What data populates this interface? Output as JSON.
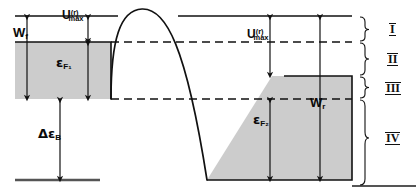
{
  "figure": {
    "type": "energy-band-diagram",
    "background_color": "#ffffff",
    "line_color": "#111111",
    "fill_color": "#cccccc",
    "dashed_color": "#111111"
  },
  "labels": {
    "u_max_left": {
      "base": "U",
      "sup": "(r)",
      "sub": "max"
    },
    "u_max_right": {
      "base": "U",
      "sup": "(r)",
      "sub": "max"
    },
    "fermi_left": {
      "base": "ε",
      "sub": "F₁"
    },
    "fermi_right": {
      "base": "ε",
      "sub": "F₂"
    },
    "work_left": {
      "base": "W",
      "sub": "f"
    },
    "work_right": {
      "base": "W",
      "sub": "r"
    },
    "bias": {
      "base": "Δε",
      "sub": "B"
    }
  },
  "regions": [
    {
      "id": "I",
      "numeral": "I"
    },
    {
      "id": "II",
      "numeral": "II"
    },
    {
      "id": "III",
      "numeral": "III"
    },
    {
      "id": "IV",
      "numeral": "IV"
    }
  ],
  "levels": {
    "vacuum_left_y": 16,
    "fermi_left_top_y": 42,
    "fermi_left_bottom_y": 99,
    "barrier_peak_y": 8,
    "vacuum_right_y": 16,
    "dashed_upper_y": 42,
    "electrode_right_top_y": 76,
    "dashed_lower_y": 99,
    "bottom_y": 180
  },
  "arrows": {
    "u_max_left": {
      "x": 88,
      "from_y": 16,
      "to_y": 42
    },
    "fermi_left": {
      "x": 88,
      "from_y": 42,
      "to_y": 99
    },
    "bias": {
      "x": 60,
      "from_y": 99,
      "to_y": 180
    },
    "u_max_right": {
      "x": 270,
      "from_y": 16,
      "to_y": 76
    },
    "fermi_right": {
      "x": 270,
      "from_y": 99,
      "to_y": 180
    },
    "w_r": {
      "x": 320,
      "from_y": 16,
      "to_y": 180
    },
    "w_f": {
      "x": 27,
      "from_y": 16,
      "to_y": 99
    }
  }
}
